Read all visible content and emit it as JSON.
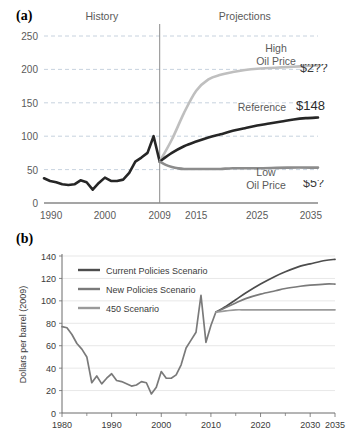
{
  "figure": {
    "panel_a_letter": "(a)",
    "panel_b_letter": "(b)"
  },
  "panel_a": {
    "region_labels": {
      "history": "History",
      "projections": "Projections"
    },
    "divider_year": "2009",
    "series_labels": {
      "high_line1": "High",
      "high_line2": "Oil Price",
      "reference": "Reference",
      "low_line1": "Low",
      "low_line2": "Oil Price"
    },
    "value_labels": {
      "high": "$2??",
      "reference": "$148",
      "low": "$5?"
    },
    "y_ticks": [
      "0",
      "50",
      "100",
      "150",
      "200",
      "250"
    ],
    "x_ticks": [
      "1990",
      "2000",
      "2009",
      "2015",
      "2025",
      "2035"
    ],
    "colors": {
      "high": "#bfbfbf",
      "reference": "#262626",
      "low": "#8c8c8c",
      "grid": "#b9c6d6",
      "axis": "#4d4d4d",
      "divider": "#8c8c8c",
      "text": "#5a5a5a"
    }
  },
  "panel_b": {
    "ylabel": "Dollars per barrel (2009)",
    "legend": [
      {
        "label": "Current Policies Scenario",
        "color": "#4d4d4d"
      },
      {
        "label": "New Policies Scenario",
        "color": "#7a7a7a"
      },
      {
        "label": "450 Scenario",
        "color": "#9a9a9a"
      }
    ],
    "y_ticks": [
      "0",
      "20",
      "40",
      "60",
      "80",
      "100",
      "120",
      "140"
    ],
    "x_ticks": [
      "1980",
      "1990",
      "2000",
      "2010",
      "2020",
      "2030",
      "2035"
    ],
    "colors": {
      "grid": "#dcdcdc",
      "axis": "#6b6b6b",
      "text": "#3a3a3a"
    }
  },
  "chart_data": [
    {
      "type": "line",
      "title": "(a) Annual Energy Outlook oil price cases",
      "xlabel": "",
      "ylabel": "",
      "xlim": [
        1990,
        2035
      ],
      "ylim": [
        0,
        250
      ],
      "grid": true,
      "legend_position": "inline-annotation",
      "annotations": [
        {
          "text": "History",
          "x": 1997,
          "y": 255
        },
        {
          "text": "Projections",
          "x": 2022,
          "y": 255
        },
        {
          "text": "High Oil Price",
          "x": 2024,
          "y": 228
        },
        {
          "text": "Reference",
          "x": 2026,
          "y": 150
        },
        {
          "text": "Low Oil Price",
          "x": 2024,
          "y": 40
        },
        {
          "text": "$2??",
          "x": 2034,
          "y": 222
        },
        {
          "text": "$148",
          "x": 2034,
          "y": 152
        },
        {
          "text": "$5?",
          "x": 2034,
          "y": 40
        }
      ],
      "divider_x": 2009,
      "series": [
        {
          "name": "History",
          "color": "#262626",
          "x": [
            1990,
            1991,
            1992,
            1993,
            1994,
            1995,
            1996,
            1997,
            1998,
            1999,
            2000,
            2001,
            2002,
            2003,
            2004,
            2005,
            2006,
            2007,
            2008,
            2009
          ],
          "values": [
            37,
            33,
            31,
            28,
            27,
            28,
            34,
            31,
            20,
            30,
            38,
            33,
            33,
            35,
            45,
            62,
            68,
            75,
            100,
            62
          ]
        },
        {
          "name": "High Oil Price",
          "color": "#bfbfbf",
          "x": [
            2009,
            2011,
            2013,
            2015,
            2017,
            2019,
            2021,
            2023,
            2025,
            2027,
            2029,
            2031,
            2033,
            2035
          ],
          "values": [
            62,
            95,
            135,
            168,
            185,
            192,
            196,
            199,
            201,
            202,
            203,
            204,
            205,
            206
          ]
        },
        {
          "name": "Reference",
          "color": "#262626",
          "x": [
            2009,
            2011,
            2013,
            2015,
            2017,
            2019,
            2021,
            2023,
            2025,
            2027,
            2029,
            2031,
            2033,
            2035
          ],
          "values": [
            62,
            75,
            85,
            92,
            98,
            103,
            108,
            112,
            116,
            119,
            122,
            125,
            127,
            128
          ]
        },
        {
          "name": "Low Oil Price",
          "color": "#8c8c8c",
          "x": [
            2009,
            2010,
            2011,
            2012,
            2013,
            2015,
            2017,
            2019,
            2021,
            2025,
            2030,
            2035
          ],
          "values": [
            62,
            57,
            54,
            52,
            51,
            51,
            51,
            51,
            52,
            52,
            53,
            53
          ]
        }
      ]
    },
    {
      "type": "line",
      "title": "(b) IEA World Energy Outlook scenarios",
      "xlabel": "",
      "ylabel": "Dollars per barrel (2009)",
      "xlim": [
        1980,
        2035
      ],
      "ylim": [
        0,
        140
      ],
      "grid": true,
      "legend_position": "top-left",
      "series": [
        {
          "name": "Historical",
          "color": "#7a7a7a",
          "x": [
            1980,
            1981,
            1982,
            1983,
            1984,
            1985,
            1986,
            1987,
            1988,
            1989,
            1990,
            1991,
            1992,
            1993,
            1994,
            1995,
            1996,
            1997,
            1998,
            1999,
            2000,
            2001,
            2002,
            2003,
            2004,
            2005,
            2006,
            2007,
            2008,
            2009,
            2010,
            2011
          ],
          "values": [
            77,
            76,
            70,
            62,
            57,
            50,
            27,
            33,
            26,
            31,
            35,
            29,
            28,
            26,
            24,
            25,
            28,
            27,
            17,
            23,
            37,
            31,
            31,
            34,
            43,
            58,
            65,
            72,
            105,
            63,
            78,
            90
          ]
        },
        {
          "name": "Current Policies Scenario",
          "color": "#4d4d4d",
          "x": [
            2011,
            2013,
            2015,
            2017,
            2020,
            2023,
            2025,
            2028,
            2030,
            2033,
            2035
          ],
          "values": [
            90,
            95,
            101,
            107,
            115,
            122,
            126,
            131,
            133,
            136,
            137
          ]
        },
        {
          "name": "New Policies Scenario",
          "color": "#7a7a7a",
          "x": [
            2011,
            2013,
            2015,
            2017,
            2020,
            2023,
            2025,
            2028,
            2030,
            2033,
            2035
          ],
          "values": [
            90,
            94,
            98,
            102,
            106,
            109,
            111,
            113,
            114,
            115,
            115
          ]
        },
        {
          "name": "450 Scenario",
          "color": "#9a9a9a",
          "x": [
            2011,
            2013,
            2015,
            2017,
            2020,
            2023,
            2025,
            2028,
            2030,
            2033,
            2035
          ],
          "values": [
            90,
            91,
            92,
            92,
            92,
            92,
            92,
            92,
            92,
            92,
            92
          ]
        }
      ]
    }
  ]
}
